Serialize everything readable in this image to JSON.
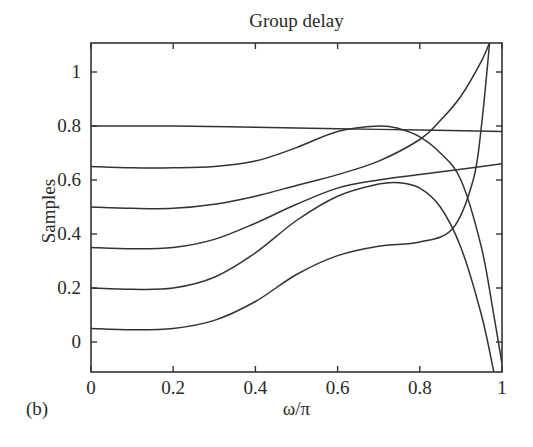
{
  "chart_data": {
    "type": "line",
    "title": "Group delay",
    "xlabel": "ω/π",
    "ylabel": "Samples",
    "panel_label": "(b)",
    "xlim": [
      0,
      1
    ],
    "ylim": [
      -0.11,
      1.11
    ],
    "xticks": [
      0,
      0.2,
      0.4,
      0.6,
      0.8,
      1
    ],
    "xtick_labels": [
      "0",
      "0.2",
      "0.4",
      "0.6",
      "0.8",
      "1"
    ],
    "yticks": [
      0,
      0.2,
      0.4,
      0.6,
      0.8,
      1
    ],
    "ytick_labels": [
      "0",
      "0.2",
      "0.4",
      "0.6",
      "0.8",
      "1"
    ],
    "grid": false,
    "legend": null,
    "line_color": "#333333",
    "series": [
      {
        "name": "curve-0.8",
        "x": [
          0,
          0.2,
          0.4,
          0.6,
          0.8,
          1.0
        ],
        "y": [
          0.8,
          0.8,
          0.795,
          0.79,
          0.785,
          0.78
        ]
      },
      {
        "name": "curve-0.65",
        "x": [
          0,
          0.1,
          0.2,
          0.3,
          0.4,
          0.5,
          0.6,
          0.7,
          0.75,
          0.8,
          0.85,
          0.9,
          0.95,
          0.98,
          1.0
        ],
        "y": [
          0.65,
          0.645,
          0.645,
          0.65,
          0.67,
          0.72,
          0.78,
          0.8,
          0.79,
          0.76,
          0.7,
          0.6,
          0.35,
          0.1,
          -0.08
        ]
      },
      {
        "name": "curve-0.5",
        "x": [
          0,
          0.1,
          0.2,
          0.3,
          0.4,
          0.5,
          0.6,
          0.7,
          0.8,
          0.85,
          0.9,
          0.95,
          0.97
        ],
        "y": [
          0.5,
          0.495,
          0.495,
          0.51,
          0.54,
          0.58,
          0.62,
          0.67,
          0.75,
          0.82,
          0.91,
          1.04,
          1.11
        ]
      },
      {
        "name": "curve-0.35",
        "x": [
          0,
          0.1,
          0.2,
          0.3,
          0.4,
          0.5,
          0.6,
          0.7,
          0.8,
          0.9,
          1.0
        ],
        "y": [
          0.35,
          0.345,
          0.35,
          0.38,
          0.44,
          0.51,
          0.57,
          0.6,
          0.62,
          0.64,
          0.66
        ]
      },
      {
        "name": "curve-0.2",
        "x": [
          0,
          0.1,
          0.2,
          0.3,
          0.4,
          0.5,
          0.6,
          0.7,
          0.75,
          0.8,
          0.85,
          0.9,
          0.95,
          0.98
        ],
        "y": [
          0.2,
          0.195,
          0.2,
          0.24,
          0.33,
          0.45,
          0.54,
          0.585,
          0.59,
          0.57,
          0.5,
          0.35,
          0.1,
          -0.11
        ]
      },
      {
        "name": "curve-0.05",
        "x": [
          0,
          0.1,
          0.2,
          0.3,
          0.4,
          0.5,
          0.6,
          0.7,
          0.8,
          0.88,
          0.93,
          0.95,
          0.97
        ],
        "y": [
          0.05,
          0.045,
          0.05,
          0.08,
          0.15,
          0.25,
          0.32,
          0.355,
          0.37,
          0.42,
          0.6,
          0.8,
          1.11
        ]
      }
    ]
  }
}
